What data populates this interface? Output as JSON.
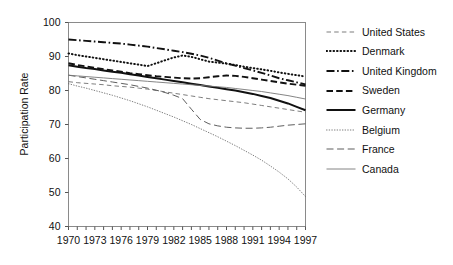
{
  "chart_data": {
    "type": "line",
    "title": "",
    "xlabel": "",
    "ylabel": "Participation Rate",
    "xlim": [
      1970,
      1997
    ],
    "ylim": [
      40,
      100
    ],
    "grid": false,
    "legend_position": "right",
    "x_tick_labels": [
      "1970",
      "1973",
      "1976",
      "1979",
      "1982",
      "1985",
      "1988",
      "1991",
      "1994",
      "1997"
    ],
    "y_tick_labels": [
      "40",
      "50",
      "60",
      "70",
      "80",
      "90",
      "100"
    ],
    "x": [
      1970,
      1971,
      1972,
      1973,
      1974,
      1975,
      1976,
      1977,
      1978,
      1979,
      1980,
      1981,
      1982,
      1983,
      1984,
      1985,
      1986,
      1987,
      1988,
      1989,
      1990,
      1991,
      1992,
      1993,
      1994,
      1995,
      1996,
      1997
    ],
    "series": [
      {
        "name": "United States",
        "style": "loosely-dashed-thin",
        "color": "#666666",
        "values": [
          82.6,
          82.3,
          82.1,
          81.9,
          81.7,
          81.4,
          81.2,
          81.0,
          80.7,
          80.4,
          80.0,
          79.6,
          79.2,
          78.8,
          78.4,
          78.0,
          77.6,
          77.3,
          77.0,
          76.7,
          76.4,
          76.0,
          75.6,
          75.2,
          74.8,
          74.4,
          74.0,
          73.6
        ]
      },
      {
        "name": "Denmark",
        "style": "dotted-bold",
        "color": "#111111",
        "values": [
          90.9,
          90.4,
          90.0,
          89.6,
          89.2,
          88.8,
          88.4,
          88.0,
          87.6,
          87.2,
          88.0,
          88.9,
          89.7,
          90.3,
          89.9,
          89.2,
          88.5,
          88.2,
          87.9,
          87.5,
          87.0,
          86.6,
          86.2,
          85.8,
          85.3,
          84.9,
          84.5,
          84.1
        ]
      },
      {
        "name": "United Kingdom",
        "style": "dash-dot-bold",
        "color": "#111111",
        "values": [
          95.0,
          94.8,
          94.6,
          94.4,
          94.2,
          94.0,
          93.8,
          93.5,
          93.2,
          92.9,
          92.5,
          92.1,
          91.7,
          91.3,
          90.8,
          90.3,
          89.6,
          88.8,
          88.0,
          87.3,
          86.6,
          85.9,
          85.2,
          84.4,
          83.6,
          83.0,
          82.4,
          81.8
        ]
      },
      {
        "name": "Sweden",
        "style": "dashed-bold",
        "color": "#111111",
        "values": [
          88.0,
          87.5,
          87.1,
          86.7,
          86.3,
          85.9,
          85.5,
          85.1,
          84.8,
          84.5,
          84.2,
          84.0,
          83.8,
          83.6,
          83.5,
          83.6,
          83.9,
          84.2,
          84.4,
          84.3,
          84.0,
          83.6,
          83.2,
          82.8,
          82.4,
          82.0,
          81.7,
          81.4
        ]
      },
      {
        "name": "Germany",
        "style": "solid-bold",
        "color": "#111111",
        "values": [
          87.4,
          87.0,
          86.6,
          86.3,
          85.9,
          85.5,
          85.2,
          84.8,
          84.4,
          84.0,
          83.6,
          83.2,
          82.8,
          82.4,
          82.0,
          81.6,
          81.2,
          80.8,
          80.4,
          80.0,
          79.5,
          79.0,
          78.4,
          77.8,
          77.0,
          76.2,
          75.2,
          74.2
        ]
      },
      {
        "name": "Belgium",
        "style": "finely-dotted-thin",
        "color": "#666666",
        "values": [
          82.0,
          81.3,
          80.7,
          80.0,
          79.3,
          78.6,
          77.8,
          77.0,
          76.1,
          75.2,
          74.2,
          73.2,
          72.2,
          71.1,
          70.0,
          68.8,
          67.6,
          66.4,
          65.1,
          63.8,
          62.4,
          61.0,
          59.5,
          57.8,
          56.0,
          54.0,
          51.6,
          48.8
        ]
      },
      {
        "name": "France",
        "style": "long-dashed-thin",
        "color": "#555555",
        "values": [
          84.5,
          84.1,
          83.7,
          83.3,
          82.9,
          82.5,
          82.1,
          81.7,
          81.2,
          80.7,
          80.1,
          79.4,
          78.6,
          77.6,
          74.5,
          71.5,
          70.2,
          69.6,
          69.2,
          69.0,
          68.9,
          68.9,
          69.0,
          69.2,
          69.5,
          69.8,
          70.0,
          70.2
        ]
      },
      {
        "name": "Canada",
        "style": "solid-thin",
        "color": "#777777",
        "values": [
          84.5,
          84.3,
          84.1,
          83.9,
          83.7,
          83.5,
          83.3,
          83.1,
          82.9,
          82.7,
          82.5,
          82.3,
          82.1,
          81.9,
          81.7,
          81.5,
          81.3,
          81.1,
          80.9,
          80.6,
          80.3,
          80.0,
          79.7,
          79.3,
          78.9,
          78.5,
          78.0,
          77.5
        ]
      }
    ]
  },
  "axes": {
    "ylabel": "Participation Rate"
  }
}
